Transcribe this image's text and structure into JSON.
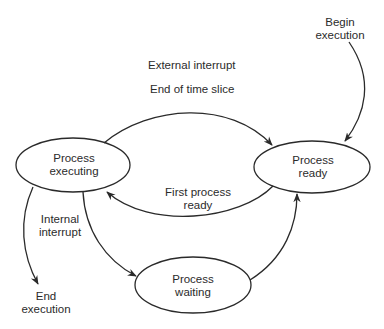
{
  "diagram": {
    "type": "state-transition",
    "states": [
      {
        "id": "executing",
        "line1": "Process",
        "line2": "executing"
      },
      {
        "id": "ready",
        "line1": "Process",
        "line2": "ready"
      },
      {
        "id": "waiting",
        "line1": "Process",
        "line2": "waiting"
      }
    ],
    "transitions": [
      {
        "from": "executing",
        "to": "ready",
        "label_line1": "External interrupt",
        "label_line2": "End of time slice"
      },
      {
        "from": "ready",
        "to": "executing",
        "label_line1": "First process",
        "label_line2": "ready"
      },
      {
        "from": "executing",
        "to": "waiting",
        "label_line1": "Internal",
        "label_line2": "interrupt"
      },
      {
        "from": "waiting",
        "to": "ready",
        "label_line1": "",
        "label_line2": ""
      },
      {
        "from": "start",
        "to": "ready",
        "label_line1": "Begin",
        "label_line2": "execution"
      },
      {
        "from": "executing",
        "to": "end",
        "label_line1": "End",
        "label_line2": "execution"
      }
    ],
    "colors": {
      "stroke": "#2a2a2a",
      "background": "#ffffff"
    }
  }
}
